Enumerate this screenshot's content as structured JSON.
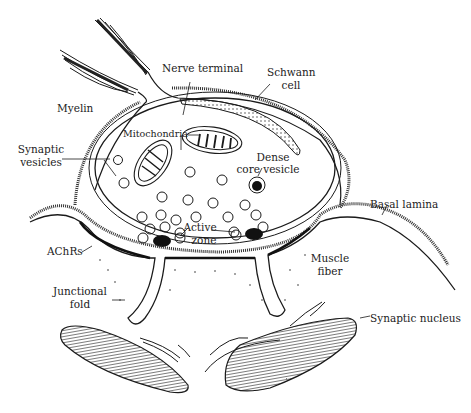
{
  "diagram": {
    "labels": {
      "nerve_terminal": "Nerve terminal",
      "schwann_cell_1": "Schwann",
      "schwann_cell_2": "cell",
      "myelin": "Myelin",
      "synaptic_vesicles_1": "Synaptic",
      "synaptic_vesicles_2": "vesicles",
      "mitochondria": "Mitochondria",
      "dense_core_vesicle_1": "Dense",
      "dense_core_vesicle_2": "core vesicle",
      "basal_lamina": "Basal lamina",
      "active_zone_1": "Active",
      "active_zone_2": "zone",
      "achrs": "AChRs",
      "muscle_fiber_1": "Muscle",
      "muscle_fiber_2": "fiber",
      "junctional_fold_1": "Junctional",
      "junctional_fold_2": "fold",
      "synaptic_nucleus": "Synaptic nucleus"
    },
    "colors": {
      "line": "#1a1a1a",
      "fill_dark": "#111111",
      "background": "#ffffff"
    }
  }
}
